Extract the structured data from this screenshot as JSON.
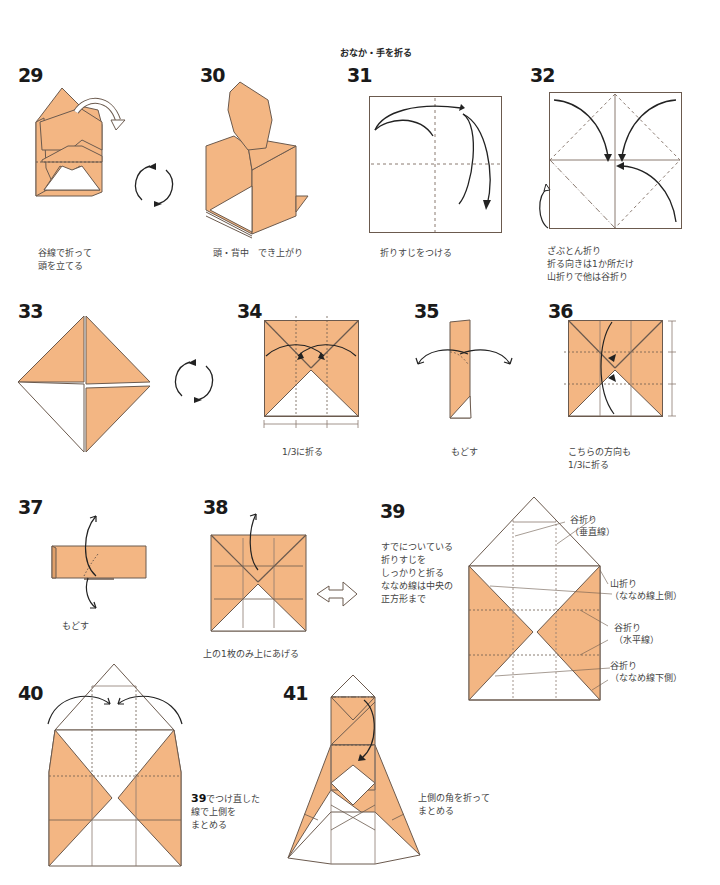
{
  "section_title": "おなか・手を折る",
  "colors": {
    "paper_orange": "#f3b683",
    "paper_white": "#ffffff",
    "line": "#6b5a4e",
    "crease": "#8a7a70",
    "arrow": "#222222"
  },
  "steps": [
    {
      "num": "29",
      "caption": "谷線で折って\n頭を立てる"
    },
    {
      "num": "30",
      "caption": "頭・背中　でき上がり"
    },
    {
      "num": "31",
      "caption": "折りすじをつける"
    },
    {
      "num": "32",
      "caption": "ざぶとん折り\n折る向きは1か所だけ\n山折りで他は谷折り"
    },
    {
      "num": "33",
      "caption": ""
    },
    {
      "num": "34",
      "caption": "1/3に折る"
    },
    {
      "num": "35",
      "caption": "もどす"
    },
    {
      "num": "36",
      "caption": "こちらの方向も\n1/3に折る"
    },
    {
      "num": "37",
      "caption": "もどす"
    },
    {
      "num": "38",
      "caption": "上の1枚のみ上にあげる"
    },
    {
      "num": "39",
      "caption": "すでについている\n折りすじを\nしっかりと折る\nななめ線は中央の\n正方形まで"
    },
    {
      "num": "40",
      "caption_ref": "39",
      "caption": "でつけ直した\n線で上側を\nまとめる"
    },
    {
      "num": "41",
      "caption": "上側の角を折って\nまとめる"
    }
  ],
  "step39_labels": [
    {
      "text": "谷折り\n（垂直線）"
    },
    {
      "text": "山折り\n（ななめ線上側）"
    },
    {
      "text": "谷折り\n（水平線）"
    },
    {
      "text": "谷折り\n（ななめ線下側）"
    }
  ],
  "icons": {
    "turn_over": "rotate-arrows-icon",
    "next": "hollow-right-arrow-icon"
  }
}
